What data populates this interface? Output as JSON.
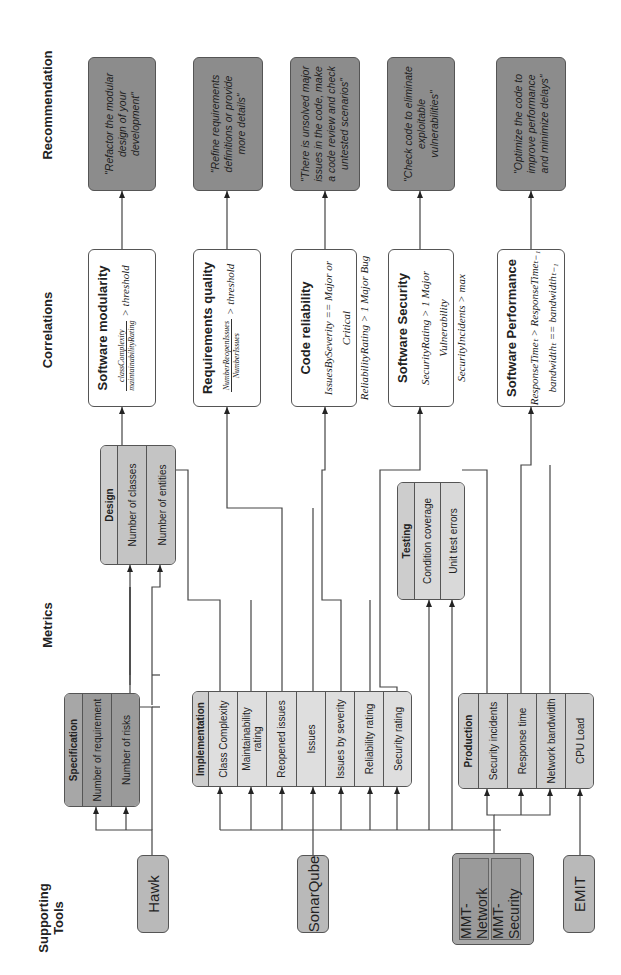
{
  "headers": {
    "tools": "Supporting Tools",
    "metrics": "Metrics",
    "correlations": "Correlations",
    "recommendation": "Recommendation"
  },
  "tools": {
    "hawk": "Hawk",
    "sonarqube": "SonarQube",
    "mmt_network": "MMT-Network",
    "mmt_security": "MMT-Security",
    "emit": "EMIT"
  },
  "metrics": {
    "specification": {
      "title": "Specification",
      "items": [
        "Number of requirement",
        "Number of risks"
      ]
    },
    "design": {
      "title": "Design",
      "items": [
        "Number of classes",
        "Number of entities"
      ]
    },
    "implementation": {
      "title": "Implementation",
      "items": [
        "Class Complexity",
        "Maintainability rating",
        "Reopened issues",
        "Issues",
        "Issues by severity",
        "Reliability rating",
        "Security rating"
      ]
    },
    "testing": {
      "title": "Testing",
      "items": [
        "Condition coverage",
        "Unit test errors"
      ]
    },
    "production": {
      "title": "Production",
      "items": [
        "Security incidents",
        "Response time",
        "Network bandwidth",
        "CPU Load"
      ]
    }
  },
  "correlations": [
    {
      "title": "Software modularity",
      "numerator": "classComplexity",
      "denominator": "maintainabilityRating",
      "rest": "> threshold"
    },
    {
      "title": "Requirements quality",
      "numerator": "NumberReopenIssues",
      "denominator": "NumberIssues",
      "rest": "> threshold"
    },
    {
      "title": "Code reliability",
      "line1": "IssuesBySeverity == Major or Critical",
      "line2": "ReliabilityRating > 1 Major Bug"
    },
    {
      "title": "Software Security",
      "line1": "SecurityRating > 1 Major Vulnerability",
      "line2": "SecurityIncidents > max"
    },
    {
      "title": "Software Performance",
      "line1": "ResponseTimeₜ > ResponseTimeₜ₋₁",
      "line2": "bandwidthₜ == bandwidthₜ₋₁"
    }
  ],
  "recommendations": [
    "\"Refactor the modular design of your development\"",
    "\"Refine requirements definitions or provide more details\"",
    "\"There is unsolved major issues in the code, make a code review and check untested scenarios\"",
    "\"Check code to eliminate exploitable vulnerabilities\"",
    "\"Optimize the code to improve performance and minimize delays\""
  ]
}
